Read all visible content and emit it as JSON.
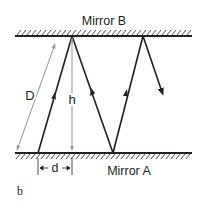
{
  "diagram": {
    "mirror_top_label": "Mirror B",
    "mirror_bottom_label": "Mirror A",
    "label_D": "D",
    "label_h": "h",
    "label_d": "d",
    "panel_label": "b",
    "colors": {
      "ray": "#231f20",
      "dimension": "#939598",
      "mirror": "#231f20"
    }
  }
}
